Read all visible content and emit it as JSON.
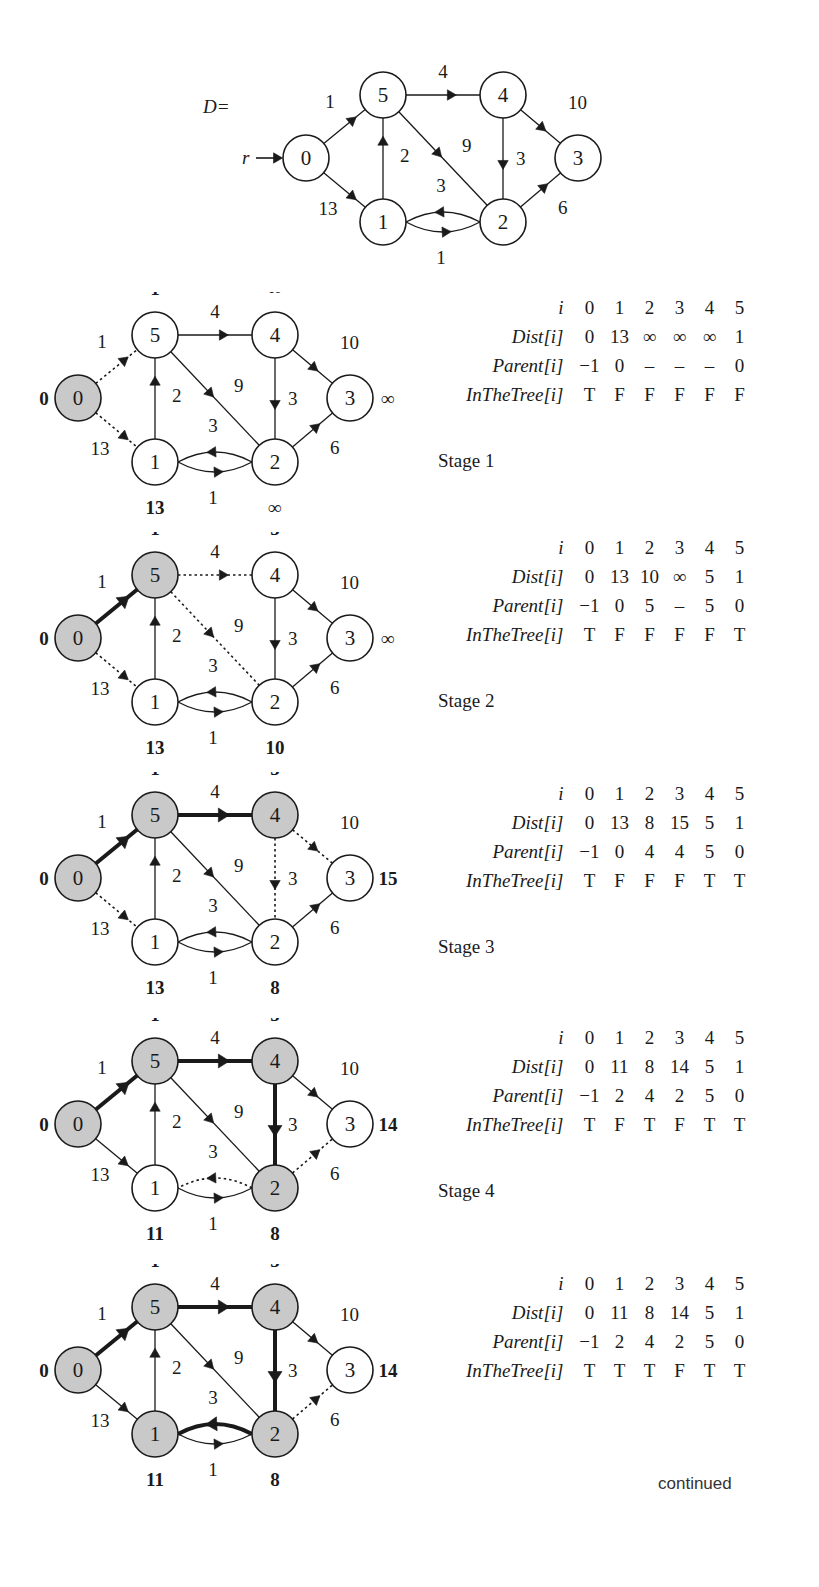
{
  "figure": {
    "d_label": "D=",
    "root_label": "r",
    "continued_label": "continued"
  },
  "graph": {
    "nodes": [
      {
        "id": "0",
        "label": "0"
      },
      {
        "id": "1",
        "label": "1"
      },
      {
        "id": "2",
        "label": "2"
      },
      {
        "id": "3",
        "label": "3"
      },
      {
        "id": "4",
        "label": "4"
      },
      {
        "id": "5",
        "label": "5"
      }
    ],
    "edges": [
      {
        "from": "0",
        "to": "5",
        "weight": "1"
      },
      {
        "from": "0",
        "to": "1",
        "weight": "13"
      },
      {
        "from": "1",
        "to": "5",
        "weight": "2"
      },
      {
        "from": "5",
        "to": "4",
        "weight": "4"
      },
      {
        "from": "5",
        "to": "2",
        "weight": "9"
      },
      {
        "from": "4",
        "to": "3",
        "weight": "10"
      },
      {
        "from": "4",
        "to": "2",
        "weight": "3"
      },
      {
        "from": "2",
        "to": "3",
        "weight": "6"
      },
      {
        "from": "2",
        "to": "1",
        "weight": "3"
      },
      {
        "from": "1",
        "to": "2",
        "weight": "1"
      }
    ]
  },
  "stages": [
    {
      "name": "Stage 1",
      "dist_labels": {
        "0": "0",
        "1": "13",
        "2": "∞",
        "3": "∞",
        "4": "∞",
        "5": "1"
      },
      "shaded": [
        "0"
      ],
      "tree_edges": [],
      "dotted_edges": [
        [
          "0",
          "5"
        ],
        [
          "0",
          "1"
        ]
      ],
      "table": {
        "rows": [
          {
            "label": "i",
            "values": [
              "0",
              "1",
              "2",
              "3",
              "4",
              "5"
            ]
          },
          {
            "label": "Dist[i]",
            "values": [
              "0",
              "13",
              "∞",
              "∞",
              "∞",
              "1"
            ]
          },
          {
            "label": "Parent[i]",
            "values": [
              "−1",
              "0",
              "–",
              "–",
              "–",
              "0"
            ]
          },
          {
            "label": "InTheTree[i]",
            "values": [
              "T",
              "F",
              "F",
              "F",
              "F",
              "F"
            ]
          }
        ]
      }
    },
    {
      "name": "Stage 2",
      "dist_labels": {
        "0": "0",
        "1": "13",
        "2": "10",
        "3": "∞",
        "4": "5",
        "5": "1"
      },
      "shaded": [
        "0",
        "5"
      ],
      "tree_edges": [
        [
          "0",
          "5"
        ]
      ],
      "dotted_edges": [
        [
          "0",
          "1"
        ],
        [
          "5",
          "4"
        ],
        [
          "5",
          "2"
        ]
      ],
      "table": {
        "rows": [
          {
            "label": "i",
            "values": [
              "0",
              "1",
              "2",
              "3",
              "4",
              "5"
            ]
          },
          {
            "label": "Dist[i]",
            "values": [
              "0",
              "13",
              "10",
              "∞",
              "5",
              "1"
            ]
          },
          {
            "label": "Parent[i]",
            "values": [
              "−1",
              "0",
              "5",
              "–",
              "5",
              "0"
            ]
          },
          {
            "label": "InTheTree[i]",
            "values": [
              "T",
              "F",
              "F",
              "F",
              "F",
              "T"
            ]
          }
        ]
      }
    },
    {
      "name": "Stage 3",
      "dist_labels": {
        "0": "0",
        "1": "13",
        "2": "8",
        "3": "15",
        "4": "5",
        "5": "1"
      },
      "shaded": [
        "0",
        "5",
        "4"
      ],
      "tree_edges": [
        [
          "0",
          "5"
        ],
        [
          "5",
          "4"
        ]
      ],
      "dotted_edges": [
        [
          "0",
          "1"
        ],
        [
          "4",
          "3"
        ],
        [
          "4",
          "2"
        ]
      ],
      "table": {
        "rows": [
          {
            "label": "i",
            "values": [
              "0",
              "1",
              "2",
              "3",
              "4",
              "5"
            ]
          },
          {
            "label": "Dist[i]",
            "values": [
              "0",
              "13",
              "8",
              "15",
              "5",
              "1"
            ]
          },
          {
            "label": "Parent[i]",
            "values": [
              "−1",
              "0",
              "4",
              "4",
              "5",
              "0"
            ]
          },
          {
            "label": "InTheTree[i]",
            "values": [
              "T",
              "F",
              "F",
              "F",
              "T",
              "T"
            ]
          }
        ]
      }
    },
    {
      "name": "Stage 4",
      "dist_labels": {
        "0": "0",
        "1": "11",
        "2": "8",
        "3": "14",
        "4": "5",
        "5": "1"
      },
      "shaded": [
        "0",
        "5",
        "4",
        "2"
      ],
      "tree_edges": [
        [
          "0",
          "5"
        ],
        [
          "5",
          "4"
        ],
        [
          "4",
          "2"
        ]
      ],
      "dotted_edges": [
        [
          "2",
          "1"
        ],
        [
          "2",
          "3"
        ]
      ],
      "table": {
        "rows": [
          {
            "label": "i",
            "values": [
              "0",
              "1",
              "2",
              "3",
              "4",
              "5"
            ]
          },
          {
            "label": "Dist[i]",
            "values": [
              "0",
              "11",
              "8",
              "14",
              "5",
              "1"
            ]
          },
          {
            "label": "Parent[i]",
            "values": [
              "−1",
              "2",
              "4",
              "2",
              "5",
              "0"
            ]
          },
          {
            "label": "InTheTree[i]",
            "values": [
              "T",
              "F",
              "T",
              "F",
              "T",
              "T"
            ]
          }
        ]
      }
    },
    {
      "name": "",
      "dist_labels": {
        "0": "0",
        "1": "11",
        "2": "8",
        "3": "14",
        "4": "5",
        "5": "1"
      },
      "shaded": [
        "0",
        "5",
        "4",
        "2",
        "1"
      ],
      "tree_edges": [
        [
          "0",
          "5"
        ],
        [
          "5",
          "4"
        ],
        [
          "4",
          "2"
        ],
        [
          "2",
          "1"
        ]
      ],
      "dotted_edges": [
        [
          "2",
          "3"
        ]
      ],
      "table": {
        "rows": [
          {
            "label": "i",
            "values": [
              "0",
              "1",
              "2",
              "3",
              "4",
              "5"
            ]
          },
          {
            "label": "Dist[i]",
            "values": [
              "0",
              "11",
              "8",
              "14",
              "5",
              "1"
            ]
          },
          {
            "label": "Parent[i]",
            "values": [
              "−1",
              "2",
              "4",
              "2",
              "5",
              "0"
            ]
          },
          {
            "label": "InTheTree[i]",
            "values": [
              "T",
              "T",
              "T",
              "F",
              "T",
              "T"
            ]
          }
        ]
      }
    }
  ],
  "colors": {
    "shaded_node_fill": "#c9c9c9",
    "node_fill": "#ffffff",
    "stroke": "#1a1a1a"
  }
}
